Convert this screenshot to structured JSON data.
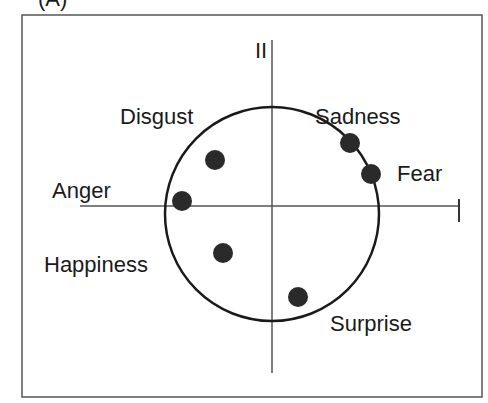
{
  "panel_label": "(A)",
  "axes": {
    "x_label": "I",
    "y_label": "II"
  },
  "colors": {
    "line": "#1a1a1a",
    "dot": "#2a2a2a",
    "frame": "#555555"
  },
  "emotions": [
    {
      "label": "Disgust",
      "x": -0.53,
      "y": 0.52
    },
    {
      "label": "Sadness",
      "x": 0.73,
      "y": 0.63
    },
    {
      "label": "Fear",
      "x": 0.93,
      "y": 0.38
    },
    {
      "label": "Anger",
      "x": -0.83,
      "y": 0.04
    },
    {
      "label": "Happiness",
      "x": -0.46,
      "y": -0.44
    },
    {
      "label": "Surprise",
      "x": 0.24,
      "y": -0.93
    }
  ]
}
